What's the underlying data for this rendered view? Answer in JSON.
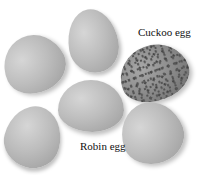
{
  "image": {
    "description": "Photograph of six eggs arranged in a ring; five pale robin eggs and one darker speckled cuckoo egg",
    "background_color": "#ffffff"
  },
  "labels": {
    "cuckoo": "Cuckoo egg",
    "robin": "Robin egg"
  },
  "eggs": [
    {
      "id": "top",
      "type": "robin"
    },
    {
      "id": "upper-left",
      "type": "robin"
    },
    {
      "id": "right",
      "type": "cuckoo"
    },
    {
      "id": "center",
      "type": "robin"
    },
    {
      "id": "lower-left",
      "type": "robin"
    },
    {
      "id": "lower-right",
      "type": "robin"
    }
  ]
}
